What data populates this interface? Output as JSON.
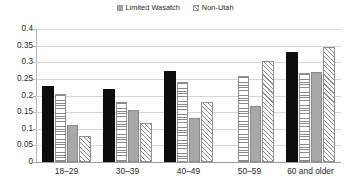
{
  "chart_data": {
    "type": "bar",
    "title": "",
    "subtitle": "",
    "xlabel": "",
    "ylabel": "",
    "categories": [
      "18–29",
      "30–39",
      "40–49",
      "50–59",
      "60 and older"
    ],
    "ylim": [
      0,
      0.4
    ],
    "yticks": [
      "0",
      "0.05",
      "0.1",
      "0.15",
      "0.2",
      "0.25",
      "0.3",
      "0.35",
      "0.4"
    ],
    "ytick_values": [
      0,
      0.05,
      0.1,
      0.15,
      0.2,
      0.25,
      0.3,
      0.35,
      0.4
    ],
    "grid": true,
    "legend_position": "top-center",
    "series": [
      {
        "name": "series-1",
        "legend_label": "",
        "pattern": "solid-black",
        "color": "#0d0d0d",
        "values": [
          0.23,
          0.22,
          0.275,
          null,
          0.33
        ]
      },
      {
        "name": "series-2",
        "legend_label": "Limited Wasatch",
        "pattern": "horizontal-lines",
        "color": "#8a8a8a",
        "values": [
          0.205,
          0.18,
          0.24,
          0.26,
          0.268
        ]
      },
      {
        "name": "series-3",
        "legend_label": "",
        "pattern": "solid-gray",
        "color": "#a8a8a8",
        "values": [
          0.11,
          0.155,
          0.133,
          0.167,
          0.271
        ]
      },
      {
        "name": "series-4",
        "legend_label": "Non-Utah",
        "pattern": "diagonal-hatch",
        "color": "#8a8a8a",
        "values": [
          0.077,
          0.118,
          0.182,
          0.304,
          0.347
        ]
      }
    ]
  },
  "legend": {
    "items": [
      {
        "label": "Limited Wasatch",
        "swatch": "gray-square"
      },
      {
        "label": "Non-Utah",
        "swatch": "hatched-square"
      }
    ]
  },
  "colors": {
    "series_black": "#0d0d0d",
    "series_gray": "#a8a8a8",
    "pattern_stroke": "#8a8a8a",
    "gridline": "#d6d6d6",
    "axis": "#9d9d9d",
    "background": "#ffffff"
  }
}
